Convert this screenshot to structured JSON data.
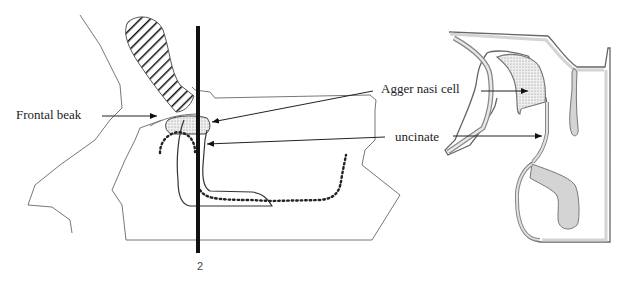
{
  "figure": {
    "left_panel": {
      "name": "sagittal-view",
      "labels": {
        "frontal_beak": "Frontal beak",
        "agger_nasi": "Agger nasi cell",
        "uncinate": "uncinate",
        "cut_line_number": "2"
      }
    },
    "right_panel": {
      "name": "coronal-view",
      "labels": {}
    },
    "colors": {
      "line": "#333333",
      "thin_line": "#777777",
      "gray_fill": "#d4d4d4",
      "stipple": "#bbbbbb",
      "cut_line": "#111111"
    }
  }
}
